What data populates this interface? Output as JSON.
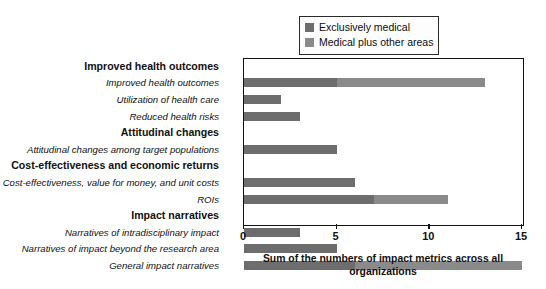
{
  "chart_data": {
    "type": "bar",
    "orientation": "horizontal",
    "stacked": true,
    "title": "",
    "xlabel": "Sum of the numbers of impact metrics across all organizations",
    "ylabel": "",
    "xlim": [
      0,
      15
    ],
    "xticks": [
      "0",
      "5",
      "10",
      "15"
    ],
    "grid": false,
    "legend_position": "top-right",
    "legend": [
      {
        "name": "Exclusively medical",
        "color": "#6d6d6d"
      },
      {
        "name": "Medical plus other areas",
        "color": "#8a8a8a"
      }
    ],
    "series": [
      {
        "name": "Exclusively medical",
        "color": "#6d6d6d"
      },
      {
        "name": "Medical plus other areas",
        "color": "#8a8a8a"
      }
    ],
    "rows": [
      {
        "label": "Improved health outcomes",
        "type": "header",
        "values": [
          0,
          0
        ],
        "total": 0
      },
      {
        "label": "Improved health outcomes",
        "type": "data",
        "values": [
          5,
          8
        ],
        "total": 13
      },
      {
        "label": "Utilization of health care",
        "type": "data",
        "values": [
          2,
          0
        ],
        "total": 2
      },
      {
        "label": "Reduced health risks",
        "type": "data",
        "values": [
          3,
          0
        ],
        "total": 3
      },
      {
        "label": "Attitudinal changes",
        "type": "header",
        "values": [
          0,
          0
        ],
        "total": 0
      },
      {
        "label": "Attitudinal changes among target populations",
        "type": "data",
        "values": [
          5,
          0
        ],
        "total": 5
      },
      {
        "label": "Cost-effectiveness and economic returns",
        "type": "header",
        "values": [
          0,
          0
        ],
        "total": 0
      },
      {
        "label": "Cost-effectiveness, value for money, and unit costs",
        "type": "data",
        "values": [
          6,
          0
        ],
        "total": 6
      },
      {
        "label": "ROIs",
        "type": "data",
        "values": [
          7,
          4
        ],
        "total": 11
      },
      {
        "label": "Impact narratives",
        "type": "header",
        "values": [
          0,
          0
        ],
        "total": 0
      },
      {
        "label": "Narratives of intradisciplinary impact",
        "type": "data",
        "values": [
          3,
          0
        ],
        "total": 3
      },
      {
        "label": "Narratives of impact beyond the research area",
        "type": "data",
        "values": [
          5,
          0
        ],
        "total": 5
      },
      {
        "label": "General impact narratives",
        "type": "data",
        "values": [
          6,
          9
        ],
        "total": 15
      }
    ],
    "categories": [
      "Improved health outcomes",
      "Utilization of health care",
      "Reduced health risks",
      "Attitudinal changes among target populations",
      "Cost-effectiveness, value for money, and unit costs",
      "ROIs",
      "Narratives of intradisciplinary impact",
      "Narratives of impact beyond the research area",
      "General impact narratives"
    ],
    "values": [
      13,
      2,
      3,
      5,
      6,
      11,
      3,
      5,
      15
    ]
  }
}
